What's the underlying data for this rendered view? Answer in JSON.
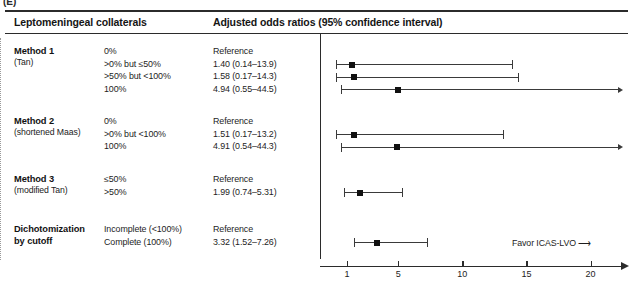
{
  "panel": {
    "label": "(E)"
  },
  "header": {
    "left": "Leptomeningeal collaterals",
    "right": "Adjusted odds ratios (95% confidence interval)"
  },
  "groups": [
    {
      "name": "Method 1",
      "sub": "(Tan)",
      "rows": [
        {
          "category": "0%",
          "estimate_text": "Reference",
          "is_reference": true,
          "or": null,
          "lo": null,
          "hi": null
        },
        {
          "category": ">0% but ≤50%",
          "estimate_text": "1.40 (0.14–13.9)",
          "is_reference": false,
          "or": 1.4,
          "lo": 0.14,
          "hi": 13.9
        },
        {
          "category": ">50% but <100%",
          "estimate_text": "1.58 (0.17–14.3)",
          "is_reference": false,
          "or": 1.58,
          "lo": 0.17,
          "hi": 14.3
        },
        {
          "category": "100%",
          "estimate_text": "4.94 (0.55–44.5)",
          "is_reference": false,
          "or": 4.94,
          "lo": 0.55,
          "hi": 44.5
        }
      ]
    },
    {
      "name": "Method 2",
      "sub": "(shortened Maas)",
      "rows": [
        {
          "category": "0%",
          "estimate_text": "Reference",
          "is_reference": true,
          "or": null,
          "lo": null,
          "hi": null
        },
        {
          "category": ">0% but <100%",
          "estimate_text": "1.51 (0.17–13.2)",
          "is_reference": false,
          "or": 1.51,
          "lo": 0.17,
          "hi": 13.2
        },
        {
          "category": "100%",
          "estimate_text": "4.91 (0.54–44.3)",
          "is_reference": false,
          "or": 4.91,
          "lo": 0.54,
          "hi": 44.3
        }
      ]
    },
    {
      "name": "Method 3",
      "sub": "(modified Tan)",
      "rows": [
        {
          "category": "≤50%",
          "estimate_text": "Reference",
          "is_reference": true,
          "or": null,
          "lo": null,
          "hi": null
        },
        {
          "category": ">50%",
          "estimate_text": "1.99 (0.74–5.31)",
          "is_reference": false,
          "or": 1.99,
          "lo": 0.74,
          "hi": 5.31
        }
      ]
    },
    {
      "name": "Dichotomization",
      "name2": "by cutoff",
      "sub": "",
      "rows": [
        {
          "category": "Incomplete (<100%)",
          "estimate_text": "Reference",
          "is_reference": true,
          "or": null,
          "lo": null,
          "hi": null
        },
        {
          "category": "Complete (100%)",
          "estimate_text": "3.32 (1.52–7.26)",
          "is_reference": false,
          "or": 3.32,
          "lo": 1.52,
          "hi": 7.26
        }
      ]
    }
  ],
  "chart_data": {
    "type": "forest",
    "title": "Adjusted odds ratios (95% confidence interval)",
    "xlabel": "",
    "ylabel": "",
    "xlim": [
      0,
      21.5
    ],
    "xticks": [
      1,
      5,
      10,
      15,
      20
    ],
    "xtick_labels": [
      "1",
      "5",
      "10",
      "15",
      "20"
    ],
    "reference_value": 1,
    "grid": false,
    "annotation": "Favor ICAS-LVO ⟶",
    "annotation_text": "Favor ICAS-LVO",
    "arrow_glyph": "⟶",
    "points": [
      {
        "label": "Method 1: >0% but ≤50%",
        "or": 1.4,
        "lo": 0.14,
        "hi": 13.9
      },
      {
        "label": "Method 1: >50% but <100%",
        "or": 1.58,
        "lo": 0.17,
        "hi": 14.3
      },
      {
        "label": "Method 1: 100%",
        "or": 4.94,
        "lo": 0.55,
        "hi": 44.5
      },
      {
        "label": "Method 2: >0% but <100%",
        "or": 1.51,
        "lo": 0.17,
        "hi": 13.2
      },
      {
        "label": "Method 2: 100%",
        "or": 4.91,
        "lo": 0.54,
        "hi": 44.3
      },
      {
        "label": "Method 3: >50%",
        "or": 1.99,
        "lo": 0.74,
        "hi": 5.31
      },
      {
        "label": "Dichotomization: Complete (100%)",
        "or": 3.32,
        "lo": 1.52,
        "hi": 7.26
      }
    ]
  },
  "axis": {
    "ticks": [
      "1",
      "5",
      "10",
      "15",
      "20"
    ]
  }
}
